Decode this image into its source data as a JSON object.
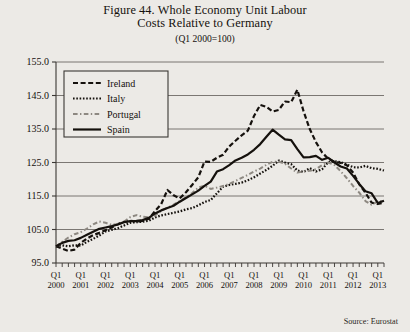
{
  "figure": {
    "title_line1": "Figure 44. Whole Economy Unit Labour",
    "title_line2": "Costs Relative to Germany",
    "subtitle": "(Q1 2000=100)",
    "source": "Source: Eurostat"
  },
  "colors": {
    "background": "#eceae6",
    "plot_background": "#eceae6",
    "axis": "#55514c",
    "grid": "#6e6a65",
    "ireland": "#15110d",
    "italy": "#15110d",
    "portugal": "#8d8881",
    "spain": "#15110d",
    "text": "#15110d"
  },
  "chart_data": {
    "type": "line",
    "title": "Figure 44. Whole Economy Unit Labour Costs Relative to Germany",
    "subtitle": "(Q1 2000=100)",
    "xlabel": "",
    "ylabel": "",
    "ylim": [
      95.0,
      155.0
    ],
    "ytick_labels": [
      "155.0",
      "145.0",
      "135.0",
      "125.0",
      "115.0",
      "105.0",
      "95.0"
    ],
    "ytick_values": [
      155.0,
      145.0,
      135.0,
      125.0,
      115.0,
      105.0,
      95.0
    ],
    "grid": true,
    "grid_axis": "y",
    "legend_position": "upper-left",
    "xtick_quarter_label": "Q1",
    "xtick_year_labels": [
      "2000",
      "2001",
      "2002",
      "2003",
      "2004",
      "2005",
      "2006",
      "2007",
      "2008",
      "2009",
      "2010",
      "2011",
      "2012",
      "2013"
    ],
    "x_minor_ticks_per_year": 4,
    "x": [
      "2000Q1",
      "2000Q2",
      "2000Q3",
      "2000Q4",
      "2001Q1",
      "2001Q2",
      "2001Q3",
      "2001Q4",
      "2002Q1",
      "2002Q2",
      "2002Q3",
      "2002Q4",
      "2003Q1",
      "2003Q2",
      "2003Q3",
      "2003Q4",
      "2004Q1",
      "2004Q2",
      "2004Q3",
      "2004Q4",
      "2005Q1",
      "2005Q2",
      "2005Q3",
      "2005Q4",
      "2006Q1",
      "2006Q2",
      "2006Q3",
      "2006Q4",
      "2007Q1",
      "2007Q2",
      "2007Q3",
      "2007Q4",
      "2008Q1",
      "2008Q2",
      "2008Q3",
      "2008Q4",
      "2009Q1",
      "2009Q2",
      "2009Q3",
      "2009Q4",
      "2010Q1",
      "2010Q2",
      "2010Q3",
      "2010Q4",
      "2011Q1",
      "2011Q2",
      "2011Q3",
      "2011Q4",
      "2012Q1",
      "2012Q2",
      "2012Q3",
      "2012Q4",
      "2013Q1",
      "2013Q2"
    ],
    "series": [
      {
        "name": "Ireland",
        "style": "dashed",
        "color": "#15110d",
        "width": 2.2,
        "dasharray": "5,2.6",
        "values": [
          100.0,
          99.3,
          98.6,
          99.0,
          101.0,
          102.3,
          103.3,
          104.0,
          104.8,
          105.6,
          106.6,
          107.3,
          107.6,
          107.4,
          107.6,
          108.2,
          110.5,
          112.6,
          116.8,
          115.2,
          114.3,
          116.1,
          118.3,
          120.6,
          125.3,
          125.2,
          126.4,
          127.3,
          129.8,
          131.5,
          133.1,
          134.5,
          138.9,
          142.2,
          141.6,
          140.2,
          140.7,
          143.2,
          143.0,
          146.7,
          140.3,
          135.0,
          131.1,
          128.0,
          126.1,
          125.2,
          124.9,
          124.2,
          122.0,
          118.5,
          116.0,
          113.0,
          112.6,
          113.0
        ]
      },
      {
        "name": "Italy",
        "style": "dotted",
        "color": "#15110d",
        "width": 2.2,
        "dasharray": "1.6,1.7",
        "values": [
          100.0,
          100.3,
          100.0,
          100.3,
          100.2,
          101.3,
          102.2,
          103.2,
          104.4,
          104.9,
          105.4,
          106.2,
          107.0,
          107.2,
          107.3,
          107.6,
          108.6,
          109.2,
          109.6,
          110.0,
          110.4,
          111.0,
          111.4,
          112.2,
          113.2,
          113.8,
          115.8,
          117.8,
          118.3,
          118.6,
          119.0,
          119.7,
          120.6,
          121.7,
          122.8,
          124.0,
          125.6,
          125.0,
          124.5,
          122.6,
          122.2,
          123.3,
          122.3,
          123.0,
          125.1,
          125.4,
          125.1,
          124.4,
          123.6,
          123.5,
          124.0,
          123.3,
          123.1,
          122.6
        ]
      },
      {
        "name": "Portugal",
        "style": "dash-dot",
        "color": "#8d8881",
        "width": 2.0,
        "dasharray": "4.6,2.4,1.4,2.4",
        "values": [
          100.0,
          101.3,
          102.6,
          103.6,
          104.2,
          105.3,
          106.5,
          107.4,
          107.0,
          106.4,
          106.6,
          107.3,
          108.7,
          109.3,
          108.8,
          108.6,
          109.2,
          110.6,
          111.5,
          112.4,
          113.5,
          114.6,
          115.9,
          117.5,
          118.1,
          117.1,
          117.5,
          118.0,
          118.6,
          119.5,
          120.4,
          121.3,
          122.3,
          123.2,
          124.3,
          125.2,
          125.3,
          124.6,
          123.2,
          122.0,
          122.3,
          122.5,
          123.0,
          124.2,
          125.0,
          124.2,
          122.4,
          120.3,
          118.0,
          116.0,
          113.5,
          112.4,
          113.4,
          113.6
        ]
      },
      {
        "name": "Spain",
        "style": "solid",
        "color": "#15110d",
        "width": 2.2,
        "dasharray": "",
        "values": [
          100.0,
          101.0,
          101.6,
          101.8,
          102.5,
          103.4,
          104.3,
          105.2,
          105.6,
          106.0,
          106.5,
          107.2,
          107.5,
          107.6,
          107.8,
          108.5,
          109.8,
          110.7,
          111.4,
          112.1,
          113.3,
          114.4,
          115.5,
          116.6,
          118.0,
          119.3,
          122.3,
          123.0,
          124.2,
          125.6,
          126.4,
          127.4,
          128.8,
          130.5,
          132.7,
          134.8,
          133.3,
          131.9,
          131.7,
          129.0,
          126.5,
          126.6,
          127.0,
          125.8,
          126.4,
          125.0,
          123.8,
          123.2,
          121.0,
          118.6,
          116.4,
          115.8,
          112.9,
          113.6
        ]
      }
    ]
  },
  "legend": {
    "items": [
      {
        "label": "Ireland"
      },
      {
        "label": "Italy"
      },
      {
        "label": "Portugal"
      },
      {
        "label": "Spain"
      }
    ]
  }
}
